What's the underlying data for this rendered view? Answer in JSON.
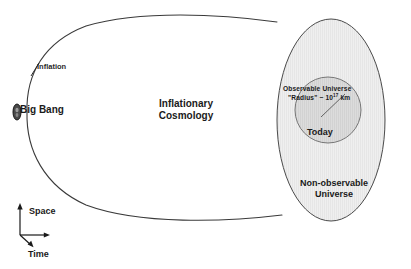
{
  "diagram": {
    "title_center": "Inflationary Cosmology",
    "labels": {
      "inflation": "Inflation",
      "big_bang": "Big Bang",
      "inflationary_cosmology_line1": "Inflationary",
      "inflationary_cosmology_line2": "Cosmology",
      "observable_universe": "Observable  Universe",
      "radius_prefix": "\"Radius\" ~ 10",
      "radius_exponent": "17",
      "radius_unit": " km",
      "today": "Today",
      "non_observable_line1": "Non-observable",
      "non_observable_line2": "Universe",
      "axis_space": "Space",
      "axis_time": "Time"
    },
    "colors": {
      "stroke": "#3a3a3a",
      "non_observable_fill": "#ededed",
      "observable_fill": "#d8d8d8",
      "big_bang_fill": "#4a4a4a",
      "text": "#1a1a1a",
      "background": "#ffffff"
    },
    "shapes": {
      "horn_name": "inflationary-horn-outline",
      "outer_ellipse_name": "non-observable-universe-ellipse",
      "inner_circle_name": "observable-universe-circle",
      "big_bang_marker_name": "big-bang-marker",
      "radius_line_name": "observable-radius-line",
      "axis_name": "space-time-axis"
    }
  }
}
